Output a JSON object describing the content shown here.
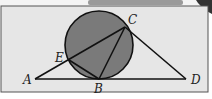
{
  "diagram": {
    "type": "geometry",
    "colors": {
      "background": "#e6e6e6",
      "circle_fill": "#7a7a7a",
      "stroke": "#111111",
      "frame": "#555555"
    },
    "points": {
      "A": {
        "label": "A",
        "x": 35,
        "y": 79
      },
      "B": {
        "label": "B",
        "x": 99,
        "y": 79
      },
      "C": {
        "label": "C",
        "x": 125,
        "y": 27
      },
      "D": {
        "label": "D",
        "x": 186,
        "y": 79
      },
      "E": {
        "label": "E",
        "x": 69,
        "y": 60
      }
    },
    "circle": {
      "cx": 99,
      "cy": 45,
      "r": 34
    },
    "segments": [
      "AD",
      "AC",
      "CD",
      "CB",
      "EB"
    ]
  }
}
